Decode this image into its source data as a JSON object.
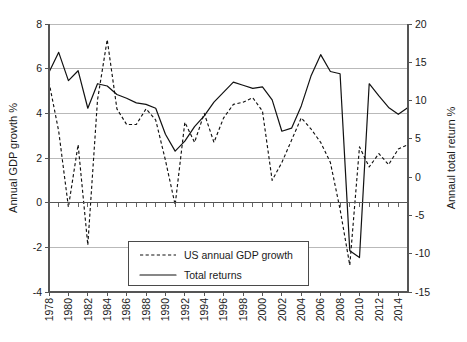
{
  "chart_data": {
    "type": "line",
    "title": "",
    "xlabel": "",
    "ylabel": "Annual GDP growth %",
    "y2label": "Annaul total return %",
    "grid": true,
    "legend_position": "bottom-center",
    "xlim": [
      1978,
      2015
    ],
    "ylim": [
      -4,
      8
    ],
    "y2lim": [
      -15,
      20
    ],
    "yticks": [
      8,
      6,
      4,
      2,
      0,
      -2,
      -4
    ],
    "ytick_labels": [
      "8",
      "6",
      "4",
      "2",
      "0",
      "-2",
      "-4"
    ],
    "y2ticks": [
      20,
      15,
      10,
      5,
      0,
      -5,
      -10,
      -15
    ],
    "y2tick_labels": [
      "20",
      "15",
      "10",
      "5",
      "0",
      "-5",
      "-10",
      "-15"
    ],
    "xticks": [
      1978,
      1980,
      1982,
      1984,
      1986,
      1988,
      1990,
      1992,
      1994,
      1996,
      1998,
      2000,
      2002,
      2004,
      2006,
      2008,
      2010,
      2012,
      2014
    ],
    "xtick_labels": [
      "1978",
      "1980",
      "1982",
      "1984",
      "1986",
      "1988",
      "1990",
      "1992",
      "1994",
      "1996",
      "1998",
      "2000",
      "2002",
      "2004",
      "2006",
      "2008",
      "2010",
      "2012",
      "2014"
    ],
    "x": [
      1978,
      1979,
      1980,
      1981,
      1982,
      1983,
      1984,
      1985,
      1986,
      1987,
      1988,
      1989,
      1990,
      1991,
      1992,
      1993,
      1994,
      1995,
      1996,
      1997,
      1998,
      1999,
      2000,
      2001,
      2002,
      2003,
      2004,
      2005,
      2006,
      2007,
      2008,
      2009,
      2010,
      2011,
      2012,
      2013,
      2014,
      2015
    ],
    "series": [
      {
        "name": "US annual GDP growth",
        "axis": "left",
        "style": "dashed",
        "values": [
          5.4,
          3.2,
          -0.2,
          2.6,
          -1.9,
          4.6,
          7.3,
          4.2,
          3.5,
          3.5,
          4.2,
          3.7,
          1.9,
          -0.1,
          3.6,
          2.7,
          4.0,
          2.7,
          3.8,
          4.4,
          4.5,
          4.7,
          4.1,
          1.0,
          1.8,
          2.8,
          3.8,
          3.3,
          2.7,
          1.8,
          -0.3,
          -2.8,
          2.5,
          1.6,
          2.2,
          1.7,
          2.4,
          2.6
        ]
      },
      {
        "name": "Total returns",
        "axis": "right",
        "style": "solid",
        "values": [
          13.7,
          16.3,
          12.6,
          13.9,
          9.0,
          12.2,
          11.9,
          10.8,
          10.3,
          9.7,
          9.5,
          9.0,
          5.6,
          3.4,
          4.7,
          6.6,
          8.0,
          9.8,
          11.1,
          12.4,
          12.0,
          11.6,
          11.8,
          10.1,
          6.0,
          6.4,
          9.3,
          13.2,
          16.0,
          13.8,
          13.5,
          -9.6,
          -10.5,
          12.2,
          10.6,
          9.1,
          8.2,
          9.1
        ]
      }
    ],
    "legend": [
      {
        "label": "US annual GDP growth",
        "style": "dashed"
      },
      {
        "label": "Total returns",
        "style": "solid"
      }
    ],
    "colors": {
      "series": "#111111",
      "grid": "#b9b9b9",
      "axis": "#555555",
      "background": "#ffffff"
    }
  }
}
